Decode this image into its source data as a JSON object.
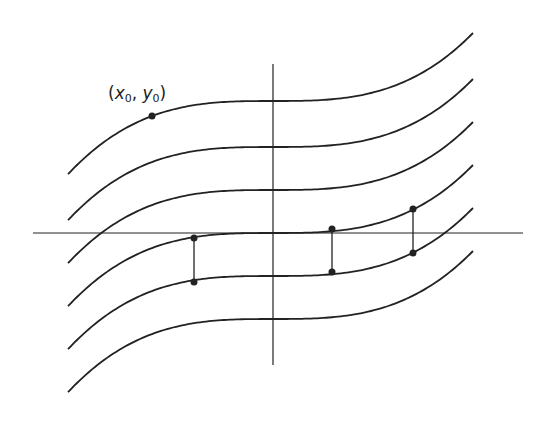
{
  "diagram": {
    "point_label": {
      "x": "x",
      "y": "y",
      "sub": "0",
      "text": "(x0, y0)"
    },
    "axes": {
      "horizontal": {
        "x1": 33,
        "x2": 523,
        "y": 233
      },
      "vertical": {
        "x": 273,
        "y1": 64,
        "y2": 365
      }
    },
    "curves": {
      "offsets": [
        101,
        147,
        190,
        233,
        276,
        319
      ],
      "x_start": 68,
      "x_end": 474,
      "center_x": 273,
      "cubic_coefficient": 8.5e-06
    },
    "marked_point": {
      "x": 152,
      "y": 116
    },
    "segments": [
      {
        "x": 194,
        "y1": 238,
        "y2": 282
      },
      {
        "x": 332,
        "y1": 229,
        "y2": 272
      },
      {
        "x": 413,
        "y1": 209,
        "y2": 253
      }
    ],
    "stroke_color": "#222222"
  }
}
